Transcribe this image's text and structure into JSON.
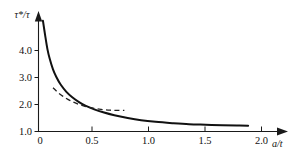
{
  "chart_data": {
    "type": "line",
    "title": "",
    "xlabel": "a/t",
    "ylabel": "τ*/τ",
    "xlim": [
      0.0,
      2.15
    ],
    "ylim": [
      1.0,
      5.3
    ],
    "grid": false,
    "legend": "none",
    "x_ticks": [
      {
        "value": 0.0,
        "label": "0"
      },
      {
        "value": 0.5,
        "label": "0.5"
      },
      {
        "value": 1.0,
        "label": "1.0"
      },
      {
        "value": 1.5,
        "label": "1.5"
      },
      {
        "value": 2.0,
        "label": "2.0"
      }
    ],
    "y_ticks": [
      {
        "value": 1.0,
        "label": "1.0"
      },
      {
        "value": 2.0,
        "label": "2.0"
      },
      {
        "value": 3.0,
        "label": "3.0"
      },
      {
        "value": 4.0,
        "label": "4.0"
      }
    ],
    "series": [
      {
        "name": "solid-curve",
        "style": "solid",
        "color": "#111111",
        "x": [
          0.04,
          0.06,
          0.08,
          0.1,
          0.13,
          0.16,
          0.2,
          0.25,
          0.3,
          0.36,
          0.42,
          0.5,
          0.58,
          0.68,
          0.8,
          0.92,
          1.05,
          1.2,
          1.35,
          1.5,
          1.65,
          1.78,
          1.88
        ],
        "y": [
          5.1,
          4.55,
          4.05,
          3.7,
          3.3,
          3.02,
          2.73,
          2.47,
          2.28,
          2.1,
          1.96,
          1.82,
          1.71,
          1.6,
          1.5,
          1.42,
          1.36,
          1.31,
          1.27,
          1.25,
          1.23,
          1.22,
          1.21
        ]
      },
      {
        "name": "dashed-curve",
        "style": "dashed",
        "color": "#222222",
        "x": [
          0.13,
          0.17,
          0.22,
          0.28,
          0.34,
          0.41,
          0.48,
          0.56,
          0.64,
          0.72,
          0.77
        ],
        "y": [
          2.62,
          2.46,
          2.3,
          2.15,
          2.04,
          1.94,
          1.87,
          1.82,
          1.79,
          1.78,
          1.78
        ]
      }
    ]
  },
  "axes": {
    "y_axis_label": "τ*/τ",
    "x_axis_label": "a/t",
    "y_tick_labels": [
      "4.0",
      "3.0",
      "2.0",
      "1.0"
    ],
    "x_tick_labels": [
      "0",
      "0.5",
      "1.0",
      "1.5",
      "2.0"
    ]
  },
  "colors": {
    "background": "#ffffff",
    "axis": "#1a1a1a",
    "solid_curve": "#111111",
    "dashed_curve": "#222222",
    "text": "#111111"
  }
}
